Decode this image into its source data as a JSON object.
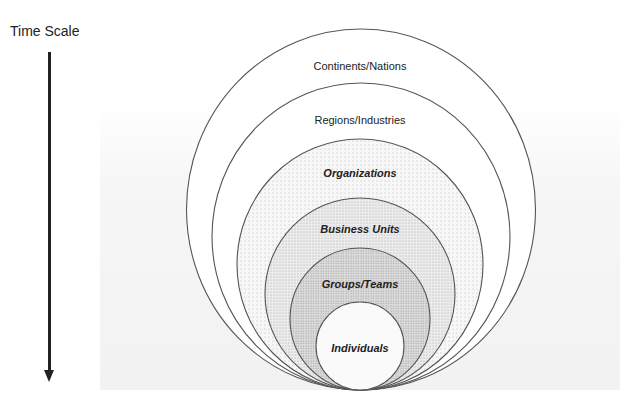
{
  "axis": {
    "label": "Time Scale",
    "direction": "down"
  },
  "diagram": {
    "type": "nested-tangent-circles",
    "levels": [
      {
        "label": "Continents/Nations",
        "style": "plain",
        "fill": "white"
      },
      {
        "label": "Regions/Industries",
        "style": "plain",
        "fill": "white"
      },
      {
        "label": "Organizations",
        "style": "bold-italic",
        "fill": "light-dots"
      },
      {
        "label": "Business Units",
        "style": "bold-italic",
        "fill": "medium-dots"
      },
      {
        "label": "Groups/Teams",
        "style": "bold-italic",
        "fill": "dense-dots"
      },
      {
        "label": "Individuals",
        "style": "bold-italic",
        "fill": "white"
      }
    ]
  },
  "colors": {
    "stroke": "#555555",
    "text": "#222222",
    "arrow": "#222222"
  }
}
